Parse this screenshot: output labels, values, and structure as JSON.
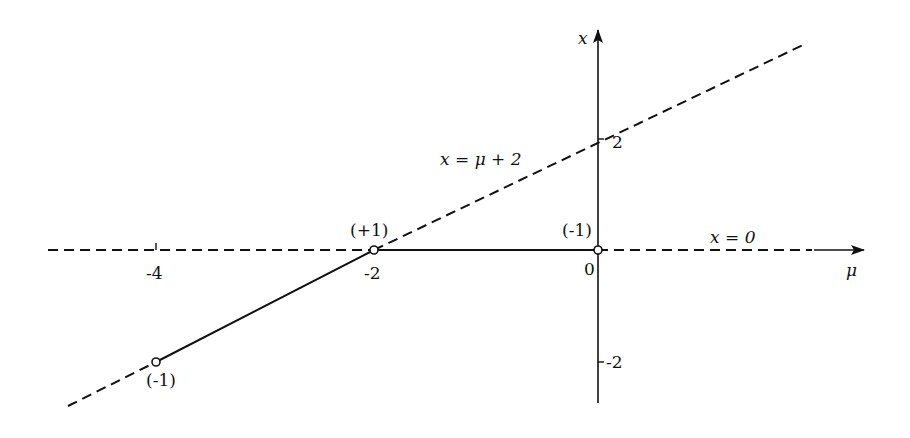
{
  "diagram": {
    "type": "bifurcation-diagram",
    "axes": {
      "horizontal": {
        "label": "μ",
        "ticks": [
          {
            "value": -4,
            "label": "-4"
          },
          {
            "value": -2,
            "label": "-2"
          },
          {
            "value": 0,
            "label": "0"
          }
        ]
      },
      "vertical": {
        "label": "x",
        "ticks": [
          {
            "value": 2,
            "label": "2"
          },
          {
            "value": -2,
            "label": "-2"
          }
        ]
      }
    },
    "curves": [
      {
        "name": "x = 0",
        "label": "x = 0",
        "segments": [
          {
            "mu_range": [
              -2,
              0
            ],
            "style": "solid"
          },
          {
            "mu_range": [
              "-inf",
              -2
            ],
            "style": "dashed"
          },
          {
            "mu_range": [
              0,
              "+inf"
            ],
            "style": "dashed"
          }
        ]
      },
      {
        "name": "x = μ + 2",
        "label": "x = μ + 2",
        "segments": [
          {
            "mu_range": [
              -4,
              -2
            ],
            "style": "solid"
          },
          {
            "mu_range": [
              "-inf",
              -4
            ],
            "style": "dashed"
          },
          {
            "mu_range": [
              -2,
              "+inf"
            ],
            "style": "dashed"
          }
        ]
      }
    ],
    "points": [
      {
        "mu": -2,
        "x": 0,
        "label": "(+1)"
      },
      {
        "mu": 0,
        "x": 0,
        "label": "(-1)"
      },
      {
        "mu": -4,
        "x": -2,
        "label": "(-1)"
      }
    ]
  }
}
